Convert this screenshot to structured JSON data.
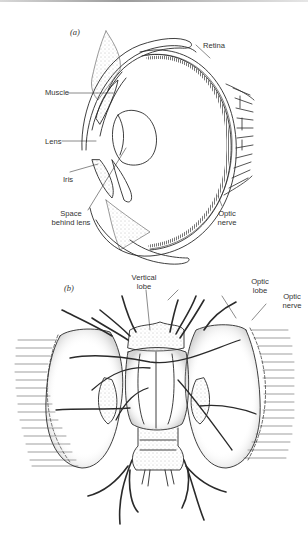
{
  "figure": {
    "panels": [
      {
        "tag": "(a)",
        "subject": "vertebrate-style eye, cross section",
        "labels": {
          "retina": "Retina",
          "muscle": "Muscle",
          "lens": "Lens",
          "iris": "Iris",
          "space_behind_lens_1": "Space",
          "space_behind_lens_2": "behind lens",
          "optic_nerve_1": "Optic",
          "optic_nerve_2": "nerve"
        }
      },
      {
        "tag": "(b)",
        "subject": "brain with optic lobes",
        "labels": {
          "vertical_lobe_1": "Vertical",
          "vertical_lobe_2": "lobe",
          "optic_lobe_1": "Optic",
          "optic_lobe_2": "lobe",
          "optic_nerve_1": "Optic",
          "optic_nerve_2": "nerve"
        }
      }
    ],
    "colors": {
      "ink": "#2a2a2a",
      "background": "#ffffff",
      "stipple": "#8a8a8a"
    }
  }
}
